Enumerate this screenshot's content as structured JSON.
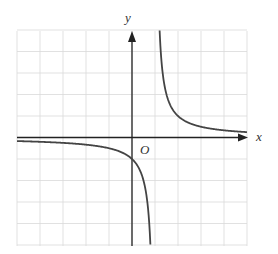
{
  "chart_data": {
    "type": "line",
    "title": "",
    "function": "y = 1/(x - 1)",
    "xlabel": "x",
    "ylabel": "y",
    "origin_label": "O",
    "xlim": [
      -5,
      5
    ],
    "ylim": [
      -5,
      5
    ],
    "grid": true,
    "grid_step": 1,
    "asymptotes": {
      "vertical": 1,
      "horizontal": 0
    },
    "series": [
      {
        "name": "left branch",
        "x": [
          -5,
          -4,
          -3,
          -2,
          -1,
          0,
          0.5,
          0.8
        ],
        "y": [
          -0.167,
          -0.2,
          -0.25,
          -0.333,
          -0.5,
          -1,
          -2,
          -5
        ]
      },
      {
        "name": "right branch",
        "x": [
          1.2,
          1.5,
          2,
          3,
          4,
          5
        ],
        "y": [
          5,
          2,
          1,
          0.5,
          0.333,
          0.25
        ]
      }
    ]
  },
  "colors": {
    "grid": "#d9d9d9",
    "axis": "#222222",
    "curve": "#444444"
  }
}
